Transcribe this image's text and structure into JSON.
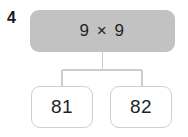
{
  "question": {
    "number": "4",
    "prompt": "9 × 9"
  },
  "options": [
    {
      "label": "81"
    },
    {
      "label": "82"
    }
  ],
  "colors": {
    "page_background": "#ffffff",
    "prompt_fill": "#c2c2c2",
    "prompt_text": "#1f1f1f",
    "option_fill": "#ffffff",
    "option_border": "#cfcfcf",
    "option_text": "#1f1f1f",
    "connector_line": "#cdcdcd",
    "number_text": "#1a1a1a"
  }
}
